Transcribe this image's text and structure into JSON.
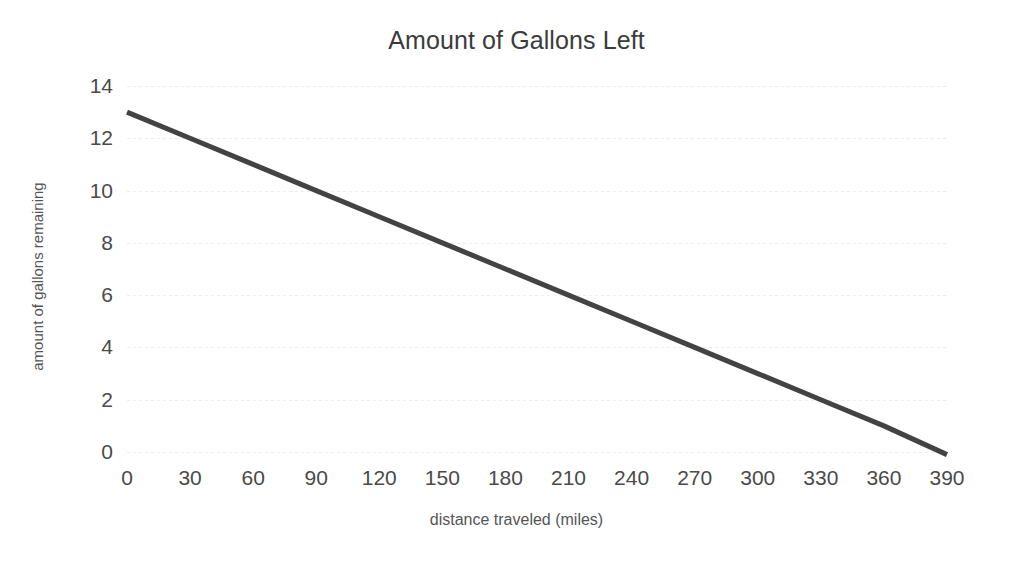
{
  "chart_data": {
    "type": "line",
    "title": "Amount of Gallons Left",
    "xlabel": "distance traveled (miles)",
    "ylabel": "amount of gallons remaining",
    "xlim": [
      0,
      390
    ],
    "ylim": [
      0,
      14
    ],
    "xticks": [
      0,
      30,
      60,
      90,
      120,
      150,
      180,
      210,
      240,
      270,
      300,
      330,
      360,
      390
    ],
    "yticks": [
      0,
      2,
      4,
      6,
      8,
      10,
      12,
      14
    ],
    "xtick_labels": [
      "0",
      "30",
      "60",
      "90",
      "120",
      "150",
      "180",
      "210",
      "240",
      "270",
      "300",
      "330",
      "360",
      "390"
    ],
    "ytick_labels": [
      "0",
      "2",
      "4",
      "6",
      "8",
      "10",
      "12",
      "14"
    ],
    "grid": true,
    "grid_axis": "y",
    "legend": false,
    "series": [
      {
        "name": "gallons remaining",
        "color": "#434343",
        "line_width": 5,
        "x": [
          0,
          30,
          60,
          90,
          120,
          150,
          180,
          210,
          240,
          270,
          300,
          330,
          360,
          390
        ],
        "values": [
          13.0,
          12.0,
          11.0,
          10.0,
          9.0,
          8.0,
          7.0,
          6.0,
          5.0,
          4.0,
          3.0,
          2.0,
          1.0,
          -0.1
        ]
      }
    ],
    "slope": -0.03333,
    "intercept": 13.0,
    "annotations": []
  },
  "style": {
    "background": "#ffffff",
    "text_color": "#434343",
    "grid_color": "#ececed",
    "line_color": "#434343"
  }
}
